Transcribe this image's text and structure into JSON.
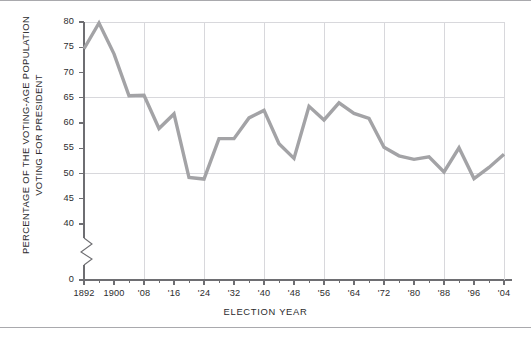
{
  "chart_data": {
    "type": "line",
    "title": "",
    "xlabel": "ELECTION YEAR",
    "ylabel_line1": "PERCENTAGE OF THE VOTING-AGE POPULATION",
    "ylabel_line2": "VOTING FOR PRESIDENT",
    "series_name": "Voter turnout",
    "line_color": "#a3a3a6",
    "grid_color": "#d8d8dc",
    "axis_color": "#6e6e72",
    "text_color": "#2c2c2e",
    "xlim": [
      1892,
      2004
    ],
    "ylim": [
      40,
      80
    ],
    "y_axis_broken": true,
    "y_break_from": 0,
    "y_break_to": 40,
    "grid": true,
    "grid_x_years": [
      1908,
      1924,
      1940,
      1956,
      1972,
      1988,
      2004
    ],
    "grid_y_values": [
      50,
      65,
      80
    ],
    "legend": "none",
    "ytick_values": [
      0,
      40,
      45,
      50,
      55,
      60,
      65,
      70,
      75,
      80
    ],
    "ytick_labels": [
      "0",
      "40",
      "45",
      "50",
      "55",
      "60",
      "65",
      "70",
      "75",
      "80"
    ],
    "xtick_years": [
      1892,
      1900,
      1908,
      1916,
      1924,
      1932,
      1940,
      1948,
      1956,
      1964,
      1972,
      1980,
      1988,
      1996,
      2004
    ],
    "xtick_labels": [
      "1892",
      "1900",
      "'08",
      "'16",
      "'24",
      "'32",
      "'40",
      "'48",
      "'56",
      "'64",
      "'72",
      "'80",
      "'88",
      "'96",
      "'04"
    ],
    "xtick_minor_years": [
      1896,
      1904,
      1912,
      1920,
      1928,
      1936,
      1944,
      1952,
      1960,
      1968,
      1976,
      1984,
      1992,
      2000
    ],
    "x": [
      1892,
      1896,
      1900,
      1904,
      1908,
      1912,
      1916,
      1920,
      1924,
      1928,
      1932,
      1936,
      1940,
      1944,
      1948,
      1952,
      1956,
      1960,
      1964,
      1968,
      1972,
      1976,
      1980,
      1984,
      1988,
      1992,
      1996,
      2000,
      2004
    ],
    "values": [
      74.7,
      79.8,
      73.7,
      65.4,
      65.5,
      58.9,
      61.8,
      49.2,
      48.9,
      56.9,
      56.9,
      61.0,
      62.5,
      55.9,
      53.0,
      63.3,
      60.6,
      64.0,
      61.9,
      60.9,
      55.2,
      53.5,
      52.8,
      53.3,
      50.3,
      55.1,
      49.0,
      51.2,
      53.8
    ],
    "data_labels": [
      {
        "year": 1892,
        "value": 74.7
      },
      {
        "year": 1896,
        "value": 79.8
      },
      {
        "year": 1900,
        "value": 73.7
      },
      {
        "year": 1904,
        "value": 65.4
      },
      {
        "year": 1908,
        "value": 65.5
      },
      {
        "year": 1912,
        "value": 58.9
      },
      {
        "year": 1916,
        "value": 61.8
      },
      {
        "year": 1920,
        "value": 49.2
      },
      {
        "year": 1924,
        "value": 48.9
      },
      {
        "year": 1928,
        "value": 56.9
      },
      {
        "year": 1932,
        "value": 56.9
      },
      {
        "year": 1936,
        "value": 61.0
      },
      {
        "year": 1940,
        "value": 62.5
      },
      {
        "year": 1944,
        "value": 55.9
      },
      {
        "year": 1948,
        "value": 53.0
      },
      {
        "year": 1952,
        "value": 63.3
      },
      {
        "year": 1956,
        "value": 60.6
      },
      {
        "year": 1960,
        "value": 64.0
      },
      {
        "year": 1964,
        "value": 61.9
      },
      {
        "year": 1968,
        "value": 60.9
      },
      {
        "year": 1972,
        "value": 55.2
      },
      {
        "year": 1976,
        "value": 53.5
      },
      {
        "year": 1980,
        "value": 52.8
      },
      {
        "year": 1984,
        "value": 53.3
      },
      {
        "year": 1988,
        "value": 50.3
      },
      {
        "year": 1992,
        "value": 55.1
      },
      {
        "year": 1996,
        "value": 49.0
      },
      {
        "year": 2000,
        "value": 51.2
      },
      {
        "year": 2004,
        "value": 53.8
      }
    ]
  }
}
